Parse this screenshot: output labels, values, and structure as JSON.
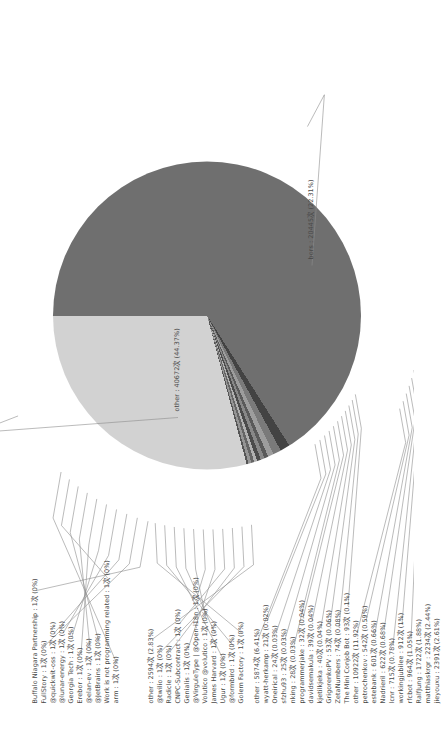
{
  "chart_data": {
    "type": "pie",
    "title": "",
    "subtitle": "",
    "xlabel": "",
    "ylabel": "",
    "legend_position": "leader-labels",
    "grid": false,
    "unit": "次",
    "orientation_note": "figure rotated 90° counter-clockwise in frame",
    "rings": [
      {
        "name": "outer-ring",
        "slices": [
          {
            "label": "other",
            "value": 40672,
            "percent": 44.37,
            "display": "other : 40672次 (44.37%)",
            "color": "#d9d9d9"
          },
          {
            "label": "bors",
            "value": 20445,
            "percent": 22.31,
            "display": "bors : 20445次 (22.31%)",
            "color": "#3f3f3f"
          },
          {
            "label": "jieyouxu",
            "value": 2391,
            "percent": 2.61,
            "display": "jieyouxu : 2391次 (2.61%)",
            "color": "#6e6e6e"
          },
          {
            "label": "matthiaskrgr",
            "value": 2234,
            "percent": 2.44,
            "display": "matthiaskrgr : 2234次 (2.44%)",
            "color": "#9a9a9a"
          },
          {
            "label": "RalfJung",
            "value": 1722,
            "percent": 1.88,
            "display": "RalfJung : 1722次 (1.88%)",
            "color": "#4e4e4e"
          },
          {
            "label": "rfcbot",
            "value": 964,
            "percent": 1.05,
            "display": "rfcbot : 964次 (1.05%)",
            "color": "#bcbcbc"
          },
          {
            "label": "workingjubilee",
            "value": 912,
            "percent": 1.0,
            "display": "workingjubilee : 912次 (1%)",
            "color": "#7d7d7d"
          },
          {
            "label": "lcnr",
            "value": 715,
            "percent": 0.78,
            "display": "lcnr : 715次 (0.78%)",
            "color": "#585858"
          },
          {
            "label": "Nadrieril",
            "value": 622,
            "percent": 0.68,
            "display": "Nadrieril : 622次 (0.68%)",
            "color": "#a8a8a8"
          },
          {
            "label": "estebank",
            "value": 601,
            "percent": 0.66,
            "display": "estebank : 601次 (0.66%)",
            "color": "#676767"
          },
          {
            "label": "petrochenkov",
            "value": 542,
            "percent": 0.59,
            "display": "petrochenkov : 542次 (0.59%)",
            "color": "#8f8f8f"
          },
          {
            "label": "other",
            "value": 10922,
            "percent": 11.92,
            "display": "other : 10922次 (11.92%)",
            "color": "#c9c9c9"
          }
        ]
      },
      {
        "name": "inner-pie",
        "slices": [
          {
            "label": "other",
            "value": 5874,
            "percent": 6.41,
            "display": "other : 5874次 (6.41%)",
            "color": "#6f6f6f"
          },
          {
            "label": "The Mini Conjob Bot",
            "value": 93,
            "percent": 0.1,
            "display": "The Mini Conjob Bot : 93次 (0.1%)",
            "color": "#434343"
          },
          {
            "label": "ZetaNumbers",
            "value": 74,
            "percent": 0.08,
            "display": "ZetaNumbers : 74次 (0.08%)",
            "color": "#7a7a7a"
          },
          {
            "label": "GrigorenkoPV",
            "value": 53,
            "percent": 0.06,
            "display": "GrigorenkoPV : 53次 (0.06%)",
            "color": "#9d9d9d"
          },
          {
            "label": "kjetilkjeka",
            "value": 40,
            "percent": 0.04,
            "display": "kjetilkjeka : 40次 (0.04%)",
            "color": "#5a5a5a"
          },
          {
            "label": "davidsemakula",
            "value": 39,
            "percent": 0.04,
            "display": "davidsemakula : 39次 (0.04%)",
            "color": "#888888"
          },
          {
            "label": "programmerjake",
            "value": 32,
            "percent": 0.04,
            "display": "programmerjake : 32次 (0.04%)",
            "color": "#4b4b4b"
          },
          {
            "label": "nking",
            "value": 28,
            "percent": 0.03,
            "display": "nking : 28次 (0.03%)",
            "color": "#b0b0b0"
          },
          {
            "label": "sfzhu93",
            "value": 25,
            "percent": 0.03,
            "display": "sfzhu93 : 25次 (0.03%)",
            "color": "#656565"
          },
          {
            "label": "Oneirical",
            "value": 24,
            "percent": 0.03,
            "display": "Oneirical : 24次 (0.03%)",
            "color": "#959595"
          },
          {
            "label": "wyatt-herkamp",
            "value": 21,
            "percent": 0.02,
            "display": "wyatt-herkamp : 21次 (0.02%)",
            "color": "#555555"
          },
          {
            "label": "other",
            "value": 2594,
            "percent": 2.83,
            "display": "other : 2594次 (2.83%)",
            "color": "#d2d2d2"
          }
        ]
      }
    ],
    "labels_top_cluster": [
      "Buffalo Niagara Partnership : 1次 (0%)",
      "FullStory : 1次 (0%)",
      "@quickwit-oss : 1次 (0%)",
      "@lunar-energy : 1次 (0%)",
      "Georgia Tech : 1次 (0%)",
      "Erebor : 1次 (0%)",
      "@elan-ev : 1次 (0%)",
      "@JetBrains : 1次 (0%)",
      "Work is not programming related : 1次 (0%)",
      "arm : 1次 (0%)"
    ],
    "labels_left_cluster": [
      "other : 2594次 (2.83%)",
      "@twilio : 1次 (0%)",
      "Radicle : 1次 (0%)",
      "CNPC-Subcontract : 1次 (0%)",
      "Genialis : 1次 (0%)",
      "@VirguleType | @Open-i18n : 1次 (0%)",
      "Volutico @volutico : 1次 (0%)",
      "James Harvard : 1次 (0%)",
      "Ugur : 1次 (0%)",
      "@formbird : 1次 (0%)",
      "Golem Factory : 1次 (0%)"
    ],
    "labels_bottom_cluster": [
      "other : 5874次 (6.41%)",
      "wyatt-herkamp : 21次 (0.02%)",
      "Oneirical : 24次 (0.03%)",
      "sfzhu93 : 25次 (0.03%)",
      "nking : 28次 (0.03%)",
      "programmerjake : 32次 (0.04%)",
      "davidsemakula : 39次 (0.04%)",
      "kjetilkjeka : 40次 (0.04%)",
      "GrigorenkoPV : 53次 (0.06%)",
      "ZetaNumbers : 74次 (0.08%)",
      "The Mini Conjob Bot : 93次 (0.1%)",
      "other : 10922次 (11.92%)",
      "petrochenkov : 542次 (0.59%)",
      "estebank : 601次 (0.66%)",
      "Nadrieril : 622次 (0.68%)",
      "lcnr : 715次 (0.78%)",
      "workingjubilee : 912次 (1%)",
      "rfcbot : 964次 (1.05%)",
      "RalfJung : 1722次 (1.88%)",
      "matthiaskrgr : 2234次 (2.44%)",
      "jieyouxu : 2391次 (2.61%)"
    ],
    "labels_right_cluster": [
      "bors : 20445次 (22.31%)"
    ],
    "label_other_outer": "other : 40672次 (44.37%)",
    "colors": {
      "background": "#ffffff",
      "text": "#494949",
      "leader_line": "#8d8d8d",
      "outer_other": "#d9d9d9",
      "outer_bors": "#3f3f3f",
      "inner_major": "#4a4a4a",
      "inner_second": "#8d8d8d"
    }
  }
}
